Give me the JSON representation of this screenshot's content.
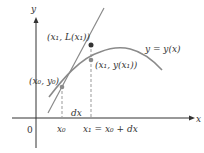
{
  "diagram": {
    "axes": {
      "x_label": "x",
      "y_label": "y",
      "origin_label": "0"
    },
    "curve_label": "y = y(x)",
    "points": {
      "p0": "(x₀, y₀)",
      "p1_tangent": "(x₁, L(x₁))",
      "p1_curve": "(x₁, y(x₁))"
    },
    "ticks": {
      "x0": "x₀",
      "x1": "x₁ = x₀ + dx"
    },
    "increment_label": "dx",
    "colors": {
      "axis": "#333333",
      "curve": "#8a8a8a",
      "tangent": "#8a8a8a",
      "tangent_point": "#333333",
      "curve_point": "#8a8a8a",
      "dashed": "#999999"
    }
  }
}
